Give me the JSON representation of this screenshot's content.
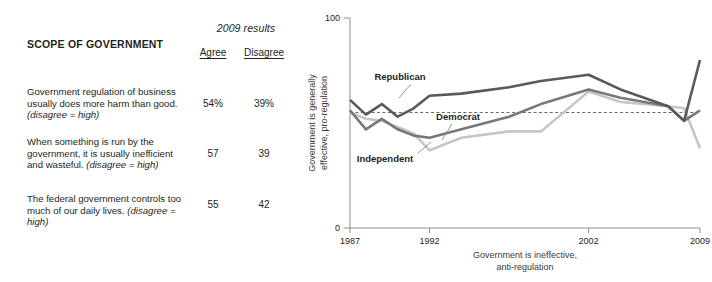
{
  "table": {
    "title": "SCOPE OF GOVERNMENT",
    "results_header": "2009 results",
    "columns": [
      "Agree",
      "Disagree"
    ],
    "rows": [
      {
        "statement_main": "Government regulation of business usually does more harm than good. ",
        "statement_note": "(disagree = high)",
        "agree": "54%",
        "disagree": "39%"
      },
      {
        "statement_main": "When something is run by the government, it is usually inefficient and wasteful. ",
        "statement_note": "(disagree = high)",
        "agree": "57",
        "disagree": "39"
      },
      {
        "statement_main": "The federal government controls too much of our daily lives. ",
        "statement_note": "(disagree = high)",
        "agree": "55",
        "disagree": "42"
      }
    ]
  },
  "chart_data": {
    "type": "line",
    "title": "",
    "xlabel": "Government is ineffective, anti-regulation",
    "xlabel_line1": "Government is ineffective,",
    "xlabel_line2": "anti-regulation",
    "ylabel": "Government is generally effective, pro-regulation",
    "ylabel_line1": "Government is generally",
    "ylabel_line2": "effective, pro-regulation",
    "ylim": [
      0,
      100
    ],
    "ytick_labels": [
      "0",
      "100"
    ],
    "yticks": [
      0,
      100
    ],
    "grid": false,
    "legend_position": "inline-annotations",
    "xtick_labels": [
      "1987",
      "1992",
      "2002",
      "2009"
    ],
    "xticks": [
      1987,
      1992,
      2002,
      2009
    ],
    "x": [
      1987,
      1988,
      1989,
      1990,
      1991,
      1992,
      1994,
      1997,
      1999,
      2002,
      2004,
      2007,
      2008,
      2009
    ],
    "reference_line": {
      "value": 55,
      "style": "dashed",
      "label": ""
    },
    "series": [
      {
        "name": "Republican",
        "color": "#5a5a5a",
        "values": [
          61,
          54,
          59,
          53,
          57,
          63,
          64,
          67,
          70,
          73,
          66,
          58,
          51,
          80
        ]
      },
      {
        "name": "Democrat",
        "color": "#787878",
        "values": [
          56,
          47,
          52,
          47,
          44,
          43,
          47,
          53,
          59,
          66,
          62,
          58,
          51,
          56
        ]
      },
      {
        "name": "Independent",
        "color": "#c6c6c6",
        "values": [
          55,
          52,
          51,
          48,
          45,
          37,
          43,
          46,
          46,
          65,
          60,
          58,
          57,
          38
        ]
      }
    ],
    "annotations": [
      {
        "text": "Republican",
        "series": "Republican"
      },
      {
        "text": "Democrat",
        "series": "Democrat"
      },
      {
        "text": "Independent",
        "series": "Independent"
      }
    ]
  }
}
